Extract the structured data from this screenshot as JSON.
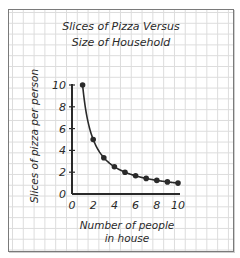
{
  "chart_data": {
    "type": "line",
    "title": "Slices of Pizza Versus Size of Household",
    "title_lines": [
      "Slices of Pizza Versus",
      "Size of Household"
    ],
    "xlabel": "Number of people in house",
    "xlabel_lines": [
      "Number of people",
      "in house"
    ],
    "ylabel": "Slices of  pizza per person",
    "x": [
      1,
      2,
      3,
      4,
      5,
      6,
      7,
      8,
      9,
      10
    ],
    "series": [
      {
        "name": "Slices per person",
        "values": [
          10,
          5,
          3.33,
          2.5,
          2,
          1.67,
          1.43,
          1.25,
          1.11,
          1
        ]
      }
    ],
    "xlim": [
      0,
      10
    ],
    "ylim": [
      0,
      10
    ],
    "xticks": [
      "0",
      "2",
      "4",
      "6",
      "8",
      "10"
    ],
    "yticks": [
      "0",
      "2",
      "4",
      "6",
      "8",
      "10"
    ],
    "grid": true,
    "legend": "none",
    "marker": "filled-circle",
    "line_color": "#2a2a2a"
  }
}
